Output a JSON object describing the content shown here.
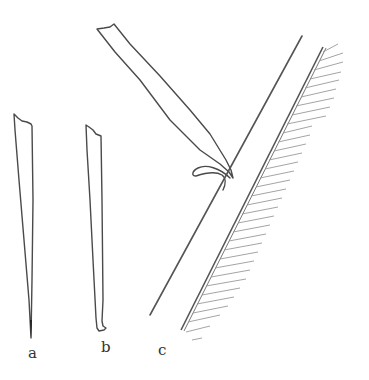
{
  "figure": {
    "panels": [
      {
        "id": "a",
        "label": "a",
        "subject": "straight tapered blade ending in a point"
      },
      {
        "id": "b",
        "label": "b",
        "subject": "tapered blade with a turned (curled) edge at the tip"
      },
      {
        "id": "c",
        "label": "c",
        "subject": "blade shaving a curl from an inclined surface with hatched backing"
      }
    ],
    "colors": {
      "line": "#4a4a4a",
      "hatch": "#9a9a9a",
      "background": "#ffffff"
    }
  }
}
